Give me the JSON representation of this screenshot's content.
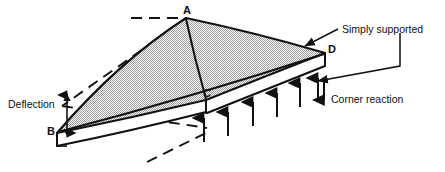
{
  "figure": {
    "kind": "engineering-diagram",
    "background_color": "#ffffff",
    "line_color": "#111111",
    "plate_fill_color": "#d4d4d4",
    "plate_edge_fill_color": "#ffffff"
  },
  "vertices": [
    {
      "id": "A",
      "label": "A",
      "role": "plate-corner-top",
      "x": 186,
      "y": 18
    },
    {
      "id": "B",
      "label": "B",
      "role": "plate-corner-left",
      "x": 57,
      "y": 133
    },
    {
      "id": "C",
      "label": "C",
      "role": "plate-corner-bottom",
      "x": 206,
      "y": 100
    },
    {
      "id": "D",
      "label": "D",
      "role": "plate-corner-right",
      "x": 325,
      "y": 53
    }
  ],
  "annotations": [
    {
      "id": "deflection",
      "label": "Deflection",
      "role": "dimension-label",
      "arrow": "double-vertical",
      "x": 8,
      "y": 99
    },
    {
      "id": "simply-supported",
      "label": "Simply supported",
      "role": "callout-label",
      "arrow": "leader-line",
      "x": 342,
      "y": 24
    },
    {
      "id": "corner-reaction",
      "label": "Corner reaction",
      "role": "callout-label",
      "arrow": "down-arrow",
      "x": 331,
      "y": 94
    }
  ],
  "reaction_arrows": {
    "direction": "up",
    "description": "Distributed upward support reactions along the simply supported edge C-D",
    "count": 6
  },
  "corner_reaction_arrow": {
    "direction": "down",
    "description": "Downward corner reaction at corner D"
  },
  "undeformed_outline": {
    "style": "dashed",
    "description": "Dashed lines indicating the original undeflected plate plane"
  }
}
